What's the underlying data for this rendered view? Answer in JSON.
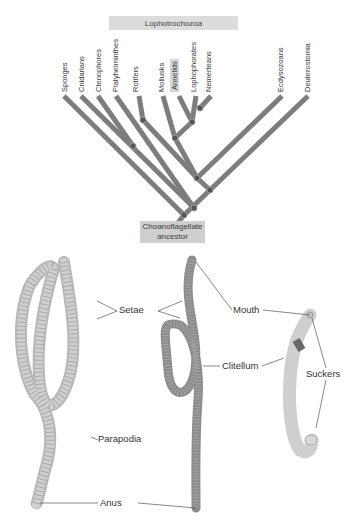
{
  "tree": {
    "group_label": "Lophotrochozoa",
    "ancestor_label_line1": "Choanoflagellate",
    "ancestor_label_line2": "ancestor",
    "taxa": [
      {
        "name": "Sponges"
      },
      {
        "name": "Cnidarians"
      },
      {
        "name": "Ctenophores"
      },
      {
        "name": "Platyhelminthes"
      },
      {
        "name": "Rotifers"
      },
      {
        "name": "Mollusks"
      },
      {
        "name": "Annelids",
        "highlighted": true
      },
      {
        "name": "Lophophorates"
      },
      {
        "name": "Nemerteans"
      },
      {
        "name": "Ecdysozoans"
      },
      {
        "name": "Deuterostomia"
      }
    ],
    "colors": {
      "branch": "#7a7a7a",
      "node": "#555555",
      "box": "#dcdcdc"
    }
  },
  "illustration": {
    "labels": {
      "setae": "Setae",
      "parapodia": "Parapodia",
      "anus": "Anus",
      "mouth": "Mouth",
      "clitellum": "Clitellum",
      "suckers": "Suckers"
    },
    "specimens": [
      "polychaete",
      "earthworm",
      "leech"
    ]
  }
}
